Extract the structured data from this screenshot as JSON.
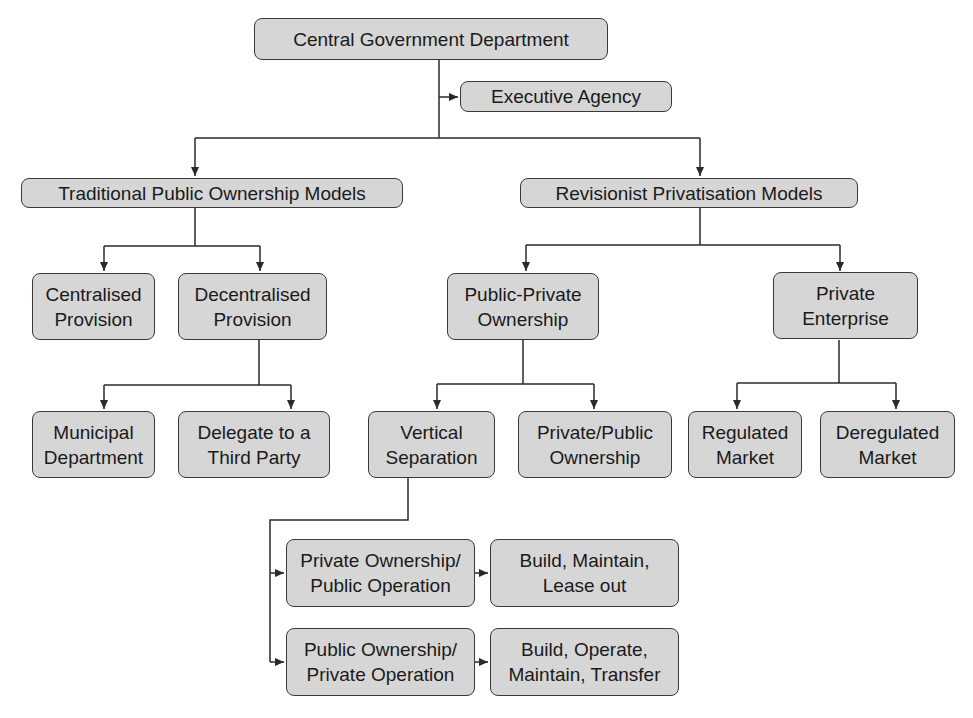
{
  "diagram": {
    "type": "organizational-flowchart",
    "colors": {
      "node_fill": "#d6d6d6",
      "node_border": "#3a3a3a",
      "line": "#2a2a2a",
      "background": "#ffffff"
    },
    "nodes": {
      "central": {
        "label": "Central Government Department"
      },
      "executive": {
        "label": "Executive Agency"
      },
      "traditional": {
        "label": "Traditional Public Ownership Models"
      },
      "revisionist": {
        "label": "Revisionist Privatisation Models"
      },
      "centralised": {
        "label": "Centralised\nProvision"
      },
      "decentralised": {
        "label": "Decentralised\nProvision"
      },
      "public_private": {
        "label": "Public-Private\nOwnership"
      },
      "private_enterprise": {
        "label": "Private\nEnterprise"
      },
      "municipal": {
        "label": "Municipal\nDepartment"
      },
      "delegate": {
        "label": "Delegate to a\nThird Party"
      },
      "vertical": {
        "label": "Vertical\nSeparation"
      },
      "private_public": {
        "label": "Private/Public\nOwnership"
      },
      "regulated": {
        "label": "Regulated\nMarket"
      },
      "deregulated": {
        "label": "Deregulated\nMarket"
      },
      "priv_own_pub_op": {
        "label": "Private Ownership/\nPublic Operation"
      },
      "bml": {
        "label": "Build, Maintain,\nLease out"
      },
      "pub_own_priv_op": {
        "label": "Public Ownership/\nPrivate Operation"
      },
      "bomt": {
        "label": "Build, Operate,\nMaintain, Transfer"
      }
    },
    "edges": [
      [
        "central",
        "executive"
      ],
      [
        "central",
        "traditional"
      ],
      [
        "central",
        "revisionist"
      ],
      [
        "traditional",
        "centralised"
      ],
      [
        "traditional",
        "decentralised"
      ],
      [
        "decentralised",
        "municipal"
      ],
      [
        "decentralised",
        "delegate"
      ],
      [
        "revisionist",
        "public_private"
      ],
      [
        "revisionist",
        "private_enterprise"
      ],
      [
        "public_private",
        "vertical"
      ],
      [
        "public_private",
        "private_public"
      ],
      [
        "private_enterprise",
        "regulated"
      ],
      [
        "private_enterprise",
        "deregulated"
      ],
      [
        "vertical",
        "priv_own_pub_op"
      ],
      [
        "vertical",
        "pub_own_priv_op"
      ],
      [
        "priv_own_pub_op",
        "bml"
      ],
      [
        "pub_own_priv_op",
        "bomt"
      ]
    ]
  }
}
